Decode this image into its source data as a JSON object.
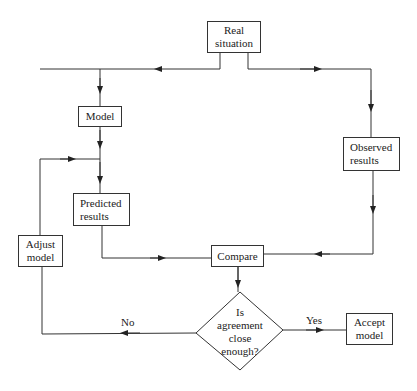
{
  "diagram": {
    "type": "flowchart",
    "nodes": {
      "real_situation": {
        "line1": "Real",
        "line2": "situation"
      },
      "model": {
        "label": "Model"
      },
      "predicted_results": {
        "line1": "Predicted",
        "line2": "results"
      },
      "observed_results": {
        "line1": "Observed",
        "line2": "results"
      },
      "adjust_model": {
        "line1": "Adjust",
        "line2": "model"
      },
      "compare": {
        "label": "Compare"
      },
      "decision": {
        "line1": "Is",
        "line2": "agreement",
        "line3": "close",
        "line4": "enough?"
      },
      "accept_model": {
        "line1": "Accept",
        "line2": "model"
      }
    },
    "edges": {
      "no_label": "No",
      "yes_label": "Yes"
    },
    "colors": {
      "line": "#333333",
      "text": "#222222",
      "background": "#ffffff"
    }
  }
}
